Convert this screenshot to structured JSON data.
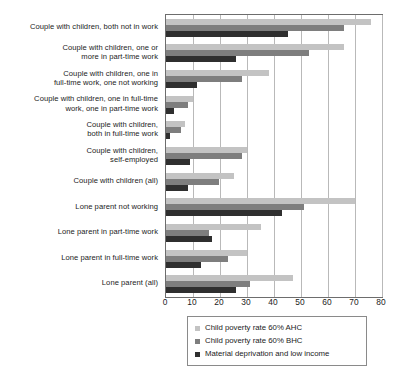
{
  "chart_data": {
    "type": "bar",
    "orientation": "horizontal",
    "title": "",
    "subtitle": "",
    "xlabel": "",
    "ylabel": "",
    "xlim": [
      0,
      80
    ],
    "xticks": [
      0,
      10,
      20,
      30,
      40,
      50,
      60,
      70,
      80
    ],
    "xtick_labels": [
      "0",
      "10",
      "20",
      "30",
      "40",
      "50",
      "60",
      "70",
      "80"
    ],
    "grid": true,
    "grid_axis": "x",
    "legend_position": "bottom",
    "categories": [
      "Couple with children, both not in work",
      "Couple with children, one or more in part-time work",
      "Couple with children, one in full-time work, one not working",
      "Couple with children, one in full-time work, one in part-time work",
      "Couple with children, both in full-time work",
      "Couple with children, self-employed",
      "Couple with children (all)",
      "Lone parent not working",
      "Lone parent in part-time work",
      "Lone parent in full-time work",
      "Lone parent (all)"
    ],
    "category_lines": [
      [
        "Couple with children, both not in work"
      ],
      [
        "Couple with children, one or",
        "more in part-time work"
      ],
      [
        "Couple with children, one in",
        "full-time work, one not working"
      ],
      [
        "Couple with children, one in full-time",
        "work, one in part-time work"
      ],
      [
        "Couple with children,",
        "both in full-time work"
      ],
      [
        "Couple with children,",
        "self-employed"
      ],
      [
        "Couple with children (all)"
      ],
      [
        "Lone parent not working"
      ],
      [
        "Lone parent in part-time work"
      ],
      [
        "Lone parent in full-time work"
      ],
      [
        "Lone parent (all)"
      ]
    ],
    "series": [
      {
        "name": "Child poverty rate 60% AHC",
        "color": "#c3c3c3",
        "values": [
          76,
          66,
          38,
          10,
          7,
          30,
          25,
          70,
          35,
          30,
          47
        ]
      },
      {
        "name": "Child poverty rate 60% BHC",
        "color": "#7e7e7e",
        "values": [
          66,
          53,
          28,
          8,
          5.5,
          28,
          19.5,
          51,
          16,
          23,
          31
        ]
      },
      {
        "name": "Material deprivation and low income",
        "color": "#2f2f2f",
        "values": [
          45,
          26,
          11.5,
          3,
          1.5,
          9,
          8,
          43,
          17,
          13,
          26
        ]
      }
    ]
  },
  "legend": {
    "items": [
      {
        "label": "Child poverty rate 60% AHC",
        "color": "#c3c3c3"
      },
      {
        "label": "Child poverty rate 60% BHC",
        "color": "#7e7e7e"
      },
      {
        "label": "Material deprivation and low income",
        "color": "#2f2f2f"
      }
    ]
  },
  "colors": {
    "axis": "#6d6d6d",
    "gridline": "#b9b9b9",
    "text": "#1b1b1b",
    "background": "#ffffff",
    "legend_border": "#8a8a8a"
  }
}
